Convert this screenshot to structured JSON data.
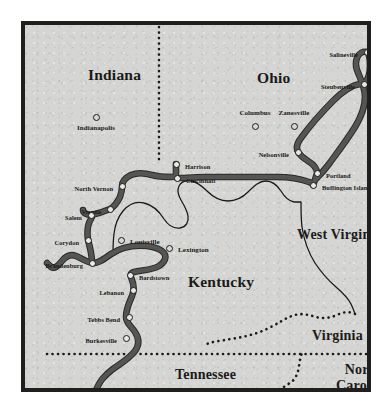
{
  "map": {
    "title": "Morgan's Raid route map",
    "background_color": "#d4d4d2",
    "frame_color": "#211f1e",
    "route_color": "#555553",
    "border_color": "#1b1a19",
    "river_color": "#1b1a19",
    "states": [
      {
        "name": "Indiana",
        "x": 63,
        "y": 41,
        "size": "big"
      },
      {
        "name": "Ohio",
        "x": 232,
        "y": 44,
        "size": "big"
      },
      {
        "name": "Kentucky",
        "x": 163,
        "y": 248,
        "size": "big"
      },
      {
        "name": "West Virginia",
        "x": 272,
        "y": 202,
        "size": "mid"
      },
      {
        "name": "Virginia",
        "x": 287,
        "y": 303,
        "size": "mid"
      },
      {
        "name": "Tennessee",
        "x": 150,
        "y": 342,
        "size": "mid"
      },
      {
        "name": "North Carolina",
        "x": 311,
        "y": 337,
        "size": "mid",
        "lines": [
          "North",
          "Carolina"
        ]
      }
    ],
    "cities": [
      {
        "name": "Indianapolis",
        "x": 71,
        "y": 92,
        "label": "below",
        "marker": "plain"
      },
      {
        "name": "Columbus",
        "x": 230,
        "y": 101,
        "label": "above",
        "marker": "plain"
      },
      {
        "name": "Zanesville",
        "x": 269,
        "y": 101,
        "label": "above",
        "marker": "plain"
      },
      {
        "name": "Lexington",
        "x": 144,
        "y": 223,
        "label": "right",
        "marker": "plain"
      },
      {
        "name": "Salineville",
        "x": 342,
        "y": 27,
        "label": "left",
        "marker": "route"
      },
      {
        "name": "Steubenville",
        "x": 339,
        "y": 59,
        "label": "left",
        "marker": "route"
      },
      {
        "name": "Nelsonville",
        "x": 273,
        "y": 127,
        "label": "left",
        "marker": "route"
      },
      {
        "name": "Portland",
        "x": 292,
        "y": 148,
        "label": "right",
        "marker": "route"
      },
      {
        "name": "Buffington Island",
        "x": 288,
        "y": 160,
        "label": "right",
        "marker": "route"
      },
      {
        "name": "Harrison",
        "x": 151,
        "y": 139,
        "label": "right",
        "marker": "route"
      },
      {
        "name": "Cincinnati",
        "x": 152,
        "y": 153,
        "label": "right",
        "marker": "route"
      },
      {
        "name": "North Vernon",
        "x": 97,
        "y": 161,
        "label": "left",
        "marker": "route"
      },
      {
        "name": "Vienna",
        "x": 85,
        "y": 184,
        "label": "left",
        "marker": "route"
      },
      {
        "name": "Salem",
        "x": 66,
        "y": 190,
        "label": "left",
        "marker": "route"
      },
      {
        "name": "Corydon",
        "x": 63,
        "y": 215,
        "label": "left",
        "marker": "route"
      },
      {
        "name": "Louisville",
        "x": 96,
        "y": 215,
        "label": "right",
        "marker": "plain"
      },
      {
        "name": "Brandenburg",
        "x": 67,
        "y": 238,
        "label": "left",
        "marker": "route"
      },
      {
        "name": "Bardstown",
        "x": 105,
        "y": 250,
        "label": "right",
        "marker": "route"
      },
      {
        "name": "Lebanon",
        "x": 108,
        "y": 265,
        "label": "left",
        "marker": "route"
      },
      {
        "name": "Tebbs Bend",
        "x": 104,
        "y": 292,
        "label": "left",
        "marker": "route"
      },
      {
        "name": "Burkesville",
        "x": 101,
        "y": 313,
        "label": "left",
        "marker": "route"
      },
      {
        "name": "Sparta",
        "x": 68,
        "y": 375,
        "label": "left",
        "marker": "route"
      }
    ],
    "route_path": "M 68 375 L 70 368 C 74 356 80 350 88 344 C 96 338 104 334 110 326 C 115 319 114 313 110 307 C 106 301 101 298 101 292 C 101 284 104 278 107 271 C 109 266 109 260 107 255 C 105 250 105 248 109 247 C 118 245 127 245 134 241 C 140 237 142 232 139 228 C 136 224 130 222 122 221 C 110 220 96 222 86 229 C 78 235 72 239 67 238 C 61 237 56 233 51 231 C 46 229 41 231 37 236 C 33 241 30 244 26 242 L 22 238 M 67 238 C 67 230 65 222 63 215 C 62 208 62 200 66 194 C 68 191 67 190 66 190 C 62 190 58 188 58 185 M 66 190 C 71 189 78 187 85 184 C 89 182 92 178 95 172 C 97 167 97 164 97 161 C 97 157 100 153 106 150 C 113 147 120 148 127 150 C 134 152 141 152 147 152 C 150 152 151 150 151 148 L 151 139 M 152 153 C 162 153 172 152 180 152 C 192 152 202 152 212 152 C 226 152 240 152 252 152 C 264 152 276 154 284 157 C 287 158 288 159 288 160 M 288 160 L 290 155 C 291 151 292 149 292 148 C 292 143 288 139 283 136 C 278 133 275 130 273 127 C 271 123 272 118 276 113 C 284 102 296 88 308 76 C 318 66 328 60 335 59 L 339 59 M 339 59 C 343 55 345 48 345 41 C 345 34 344 29 342 27 M 342 27 C 338 26 334 28 332 33 C 330 38 331 44 334 50 C 337 57 340 64 340 72 C 340 82 336 92 330 102 C 322 115 312 128 304 139 C 298 147 293 152 290 155",
    "river_path": "M 22 238 C 27 240 31 241 36 237 C 41 232 45 230 51 232 C 57 234 61 238 67 239 C 73 240 80 236 88 231 C 97 225 110 220 122 221 C 132 222 138 225 140 229 C 142 233 139 237 133 241 C 126 245 117 246 109 247 M 88 231 C 88 224 88 216 89 209 C 90 200 93 192 98 186 C 104 179 111 176 119 178 C 128 180 134 186 139 194 C 143 200 148 204 155 203 C 161 202 164 197 163 191 C 162 185 159 180 156 175 C 153 170 152 165 154 161 C 156 157 160 155 166 156 C 172 157 177 161 182 166 C 188 172 195 176 203 176 C 212 176 218 172 223 167 C 229 161 234 156 241 156 C 247 156 252 160 256 166 C 259 171 263 176 269 177 L 276 177 M 276 177 C 276 185 276 194 277 202 C 279 215 283 227 290 238 C 296 247 303 255 311 262 C 318 268 323 273 326 279 C 328 283 329 286 330 289",
    "state_borders": [
      {
        "name": "indiana-ohio",
        "path": "M 134 2 L 134 138"
      },
      {
        "name": "ohio-wv-east",
        "path": "M 346 2 L 347 20 L 347 40 L 347 70 L 347 100 L 347 125"
      },
      {
        "name": "ky-va",
        "path": "M 330 289 C 324 286 318 287 312 290 C 305 293 298 294 291 292 C 284 290 277 288 270 290 C 262 292 254 298 244 303 C 232 309 219 312 206 314 C 194 316 186 317 182 319"
      },
      {
        "name": "ky-tn",
        "path": "M 22 329 L 346 329"
      },
      {
        "name": "va-nc",
        "path": "M 247 373 C 252 367 258 362 265 358 C 270 355 273 349 274 341 C 275 334 276 330 277 328"
      }
    ],
    "border_dot_color": "#1b1a19"
  }
}
